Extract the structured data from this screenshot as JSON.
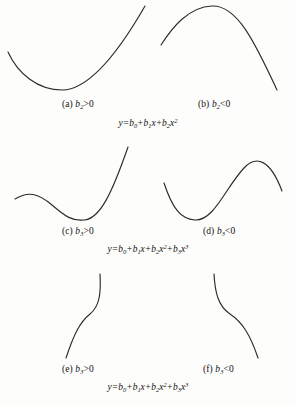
{
  "figure": {
    "panels": [
      {
        "id": "a",
        "label_prefix": "(a)",
        "coef": "b",
        "subscript": "2",
        "relation": ">0",
        "shape": "upward-parabola"
      },
      {
        "id": "b",
        "label_prefix": "(b)",
        "coef": "b",
        "subscript": "2",
        "relation": "<0",
        "shape": "downward-parabola"
      },
      {
        "id": "c",
        "label_prefix": "(c)",
        "coef": "b",
        "subscript": "3",
        "relation": ">0",
        "shape": "cubic-increasing-with-local-minimum"
      },
      {
        "id": "d",
        "label_prefix": "(d)",
        "coef": "b",
        "subscript": "3",
        "relation": "<0",
        "shape": "cubic-decreasing-with-local-maximum"
      },
      {
        "id": "e",
        "label_prefix": "(e)",
        "coef": "b",
        "subscript": "3",
        "relation": ">0",
        "shape": "steep-monotonic-increasing-cubic"
      },
      {
        "id": "f",
        "label_prefix": "(f)",
        "coef": "b",
        "subscript": "3",
        "relation": "<0",
        "shape": "steep-monotonic-decreasing-cubic"
      }
    ],
    "equations": {
      "quadratic": {
        "lhs": "y",
        "terms": [
          "b",
          "0",
          "+",
          "b",
          "1",
          "x",
          "+",
          "b",
          "2",
          "x",
          "2"
        ],
        "plain": "y=b0+b1x+b2x^2"
      },
      "cubic": {
        "lhs": "y",
        "plain": "y=b0+b1x+b2x^2+b3x^3"
      }
    },
    "caption": {
      "text": "",
      "note": "clipped-by-image-edge"
    },
    "colors": {
      "curve": "#2b2b2b",
      "text": "#121212",
      "background": "#fdfdfc"
    }
  }
}
